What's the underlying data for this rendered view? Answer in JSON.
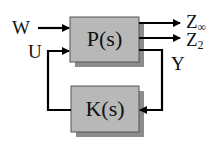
{
  "diagram": {
    "type": "feedback-block-diagram",
    "blocks": [
      {
        "id": "plant",
        "label": "P(s)"
      },
      {
        "id": "controller",
        "label": "K(s)"
      }
    ],
    "signals": {
      "w": "W",
      "u": "U",
      "y": "Y",
      "z_inf_base": "Z",
      "z_inf_sub": "∞",
      "z2_base": "Z",
      "z2_sub": "2"
    },
    "colors": {
      "block_fill": "#b8b8b8",
      "block_shadow": "#8c8c8c",
      "line": "#000000"
    }
  }
}
